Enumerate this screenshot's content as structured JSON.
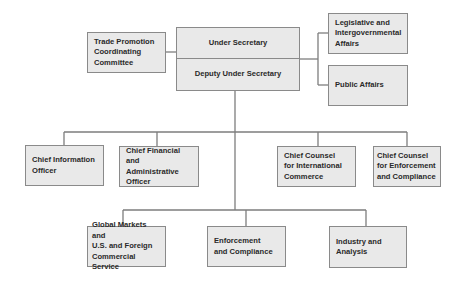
{
  "diagram": {
    "type": "org-chart",
    "colors": {
      "box_fill": "#e9e9e9",
      "box_border": "#8a8a8a",
      "line": "#7d7d7d",
      "text": "#2a2a2a"
    },
    "top": {
      "under_secretary": "Under Secretary",
      "deputy_under_secretary": "Deputy Under Secretary"
    },
    "left_staff": {
      "trade_promotion": "Trade Promotion\nCoordinating\nCommittee"
    },
    "right_staff": {
      "legislative": "Legislative and\nIntergovernmental\nAffairs",
      "public_affairs": "Public Affairs"
    },
    "staff_offices": [
      {
        "label": "Chief Information\nOfficer"
      },
      {
        "label": "Chief Financial and\nAdministrative\nOfficer"
      },
      {
        "label": "Chief Counsel\nfor International\nCommerce"
      },
      {
        "label": "Chief Counsel\nfor Enforcement\nand Compliance"
      }
    ],
    "business_units": [
      {
        "label": "Global Markets and\nU.S. and Foreign\nCommercial Service"
      },
      {
        "label": "Enforcement\nand Compliance"
      },
      {
        "label": "Industry and\nAnalysis"
      }
    ]
  }
}
